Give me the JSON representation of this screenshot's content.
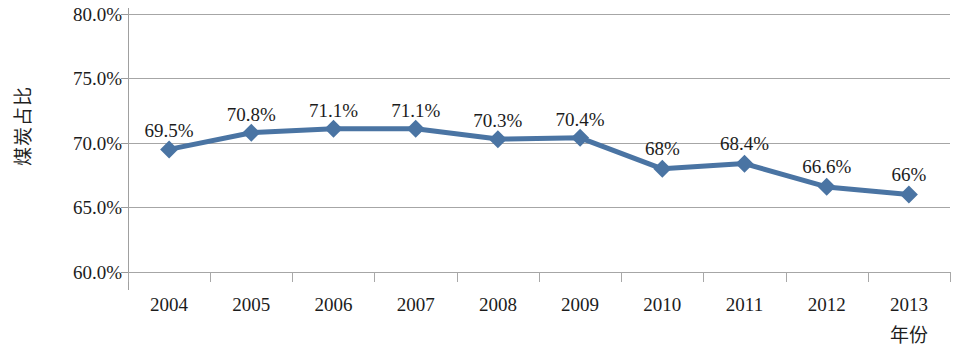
{
  "chart_data": {
    "type": "line",
    "title": "",
    "xlabel": "年份",
    "ylabel": "煤炭占比",
    "categories": [
      "2004",
      "2005",
      "2006",
      "2007",
      "2008",
      "2009",
      "2010",
      "2011",
      "2012",
      "2013"
    ],
    "values": [
      69.5,
      70.8,
      71.1,
      71.1,
      70.3,
      70.4,
      68.0,
      68.4,
      66.6,
      66.0
    ],
    "point_labels": [
      "69.5%",
      "70.8%",
      "71.1%",
      "71.1%",
      "70.3%",
      "70.4%",
      "68%",
      "68.4%",
      "66.6%",
      "66%"
    ],
    "ylim": [
      60,
      80
    ],
    "y_ticks": [
      80,
      75,
      70,
      65,
      60
    ],
    "y_tick_labels": [
      "80.0%",
      "75.0%",
      "70.0%",
      "65.0%",
      "60.0%"
    ],
    "grid": true,
    "legend": false,
    "legend_position": "none",
    "series": [
      {
        "name": "煤炭占比",
        "values": [
          69.5,
          70.8,
          71.1,
          71.1,
          70.3,
          70.4,
          68.0,
          68.4,
          66.6,
          66.0
        ],
        "color": "#4a74a3",
        "marker": "diamond",
        "marker_color": "#4a74a3"
      }
    ]
  },
  "axes": {
    "y_title": "煤炭占比",
    "x_title": "年份"
  },
  "colors": {
    "series": "#4a74a3",
    "gridline": "#a6a6a6",
    "axis": "#a0a0a0",
    "text": "#1c1c1c",
    "background": "#ffffff"
  }
}
